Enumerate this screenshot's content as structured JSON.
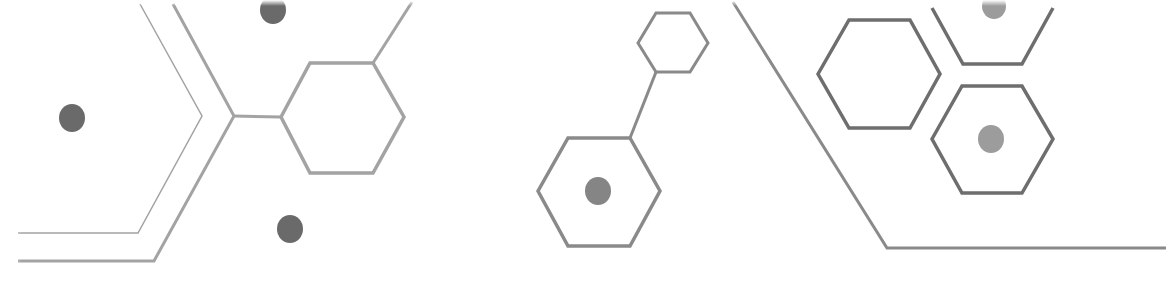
{
  "graphic": {
    "title": "Decorative hexagon molecular pattern",
    "colors": {
      "background": "#ffffff",
      "stroke_light": "#a3a3a3",
      "stroke_mid": "#8a8a8a",
      "stroke_dark": "#6e6e6e",
      "dot_dark": "#6a6a6a",
      "dot_mid": "#858585",
      "dot_light": "#9c9c9c"
    },
    "polylines": [
      {
        "name": "thin-chevron-line",
        "points": "18,233 138,233 202,116 140,4",
        "color": "stroke_light",
        "width": 1.5
      },
      {
        "name": "thick-chevron-line",
        "points": "18,261 154,261 234,116 173,4",
        "color": "stroke_light",
        "width": 3
      },
      {
        "name": "connector-left-hex",
        "points": "234,116 281,117",
        "color": "stroke_light",
        "width": 3
      },
      {
        "name": "connector-hex-top-right",
        "points": "373,63 412,2",
        "color": "stroke_light",
        "width": 3
      },
      {
        "name": "connector-small-hex-to-large-hex",
        "points": "656,72 630,138",
        "color": "stroke_mid",
        "width": 3
      },
      {
        "name": "diagonal-right-line",
        "points": "733,2 887,248 1166,248",
        "color": "stroke_mid",
        "width": 3
      }
    ],
    "hexagons": [
      {
        "name": "hex-left",
        "points": "281,117 310,63 373,63 404,117 373,173 310,173",
        "color": "stroke_light",
        "width": 3.5
      },
      {
        "name": "hex-small-top",
        "points": "638,43 656,13 690,13 708,43 690,72 656,72",
        "color": "stroke_mid",
        "width": 3
      },
      {
        "name": "hex-bottom-center",
        "points": "538,191 568,138 630,138 660,191 630,246 568,246",
        "color": "stroke_mid",
        "width": 3.5
      },
      {
        "name": "hex-right-upper-left",
        "points": "818,74 849,20 910,20 940,74 910,128 849,128",
        "color": "stroke_dark",
        "width": 3.5
      },
      {
        "name": "hex-right-top-partial",
        "points": "932,8 963,64 1022,64 1053,8",
        "color": "stroke_dark",
        "width": 3.5
      },
      {
        "name": "hex-right-lower",
        "points": "932,139 962,86 1022,86 1053,139 1022,193 962,193",
        "color": "stroke_dark",
        "width": 3.5
      }
    ],
    "dots": [
      {
        "name": "dot-left",
        "cx": 72,
        "cy": 118,
        "r": 13,
        "color": "dot_dark"
      },
      {
        "name": "dot-top",
        "cx": 273,
        "cy": 10,
        "r": 13,
        "color": "dot_dark"
      },
      {
        "name": "dot-bottom",
        "cx": 290,
        "cy": 229,
        "r": 13,
        "color": "dot_dark"
      },
      {
        "name": "dot-in-hex-bottom-center",
        "cx": 598,
        "cy": 191,
        "r": 13,
        "color": "dot_mid"
      },
      {
        "name": "dot-top-right",
        "cx": 994,
        "cy": 6,
        "r": 12,
        "color": "dot_light"
      },
      {
        "name": "dot-in-hex-right-lower",
        "cx": 991,
        "cy": 139,
        "r": 13,
        "color": "dot_light"
      }
    ]
  }
}
